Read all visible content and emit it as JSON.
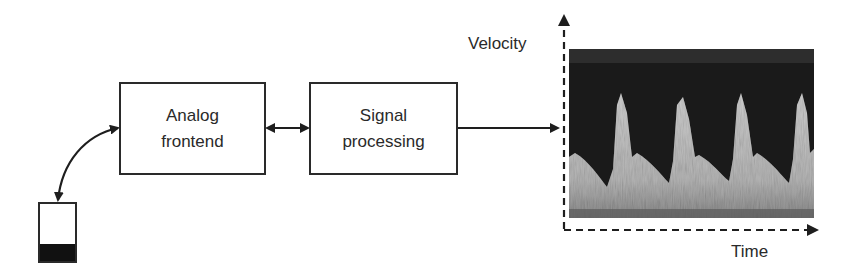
{
  "diagram": {
    "nodes": [
      {
        "id": "battery",
        "label": "",
        "icon": "battery-icon",
        "charge_level": "low"
      },
      {
        "id": "analog_frontend",
        "lines": [
          "Analog",
          "frontend"
        ]
      },
      {
        "id": "signal_processing",
        "lines": [
          "Signal",
          "processing"
        ]
      },
      {
        "id": "spectrogram",
        "label": "",
        "icon": "doppler-spectrogram"
      }
    ],
    "edges": [
      {
        "from": "battery",
        "to": "analog_frontend",
        "style": "curved",
        "direction": "bidirectional"
      },
      {
        "from": "analog_frontend",
        "to": "signal_processing",
        "style": "straight",
        "direction": "bidirectional"
      },
      {
        "from": "signal_processing",
        "to": "spectrogram",
        "style": "straight",
        "direction": "forward"
      }
    ],
    "plot": {
      "y_axis_label": "Velocity",
      "x_axis_label": "Time",
      "axis_style": "dashed",
      "peaks": 4
    }
  },
  "colors": {
    "stroke": "#2a2a2a",
    "background": "#ffffff",
    "spectrogram_dark": "#1a1a1a",
    "spectrogram_light": "#b8b8b8"
  }
}
